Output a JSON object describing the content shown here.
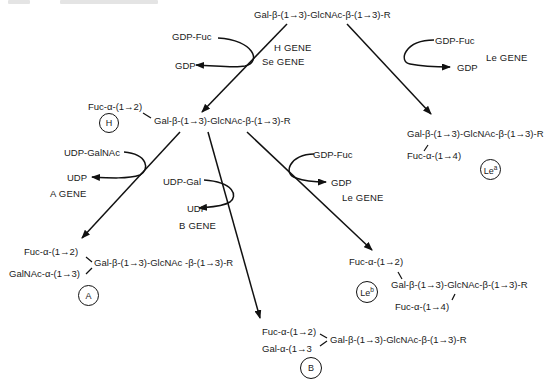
{
  "header_fragments": {
    "left": "",
    "right": ""
  },
  "precursor": {
    "structure": "Gal-β-(1→3)-GlcNAc-β-(1→3)-R"
  },
  "h_step": {
    "donor": "GDP-Fuc",
    "product": "GDP",
    "genes": [
      "H GENE",
      "Se GENE"
    ]
  },
  "lea_step": {
    "donor": "GDP-Fuc",
    "product": "GDP",
    "gene": "Le GENE"
  },
  "h_antigen": {
    "label": "H",
    "substituent": "Fuc-α-(1→2)",
    "core": "Gal-β-(1→3)-GlcNAc-β-(1→3)-R"
  },
  "lea_antigen": {
    "label": "Le",
    "label_sup": "a",
    "core": "Gal-β-(1→3)-GlcNAc-β-(1→3)-R",
    "substituent": "Fuc-α-(1→4)"
  },
  "a_step": {
    "donor": "UDP-GalNAc",
    "product": "UDP",
    "gene": "A GENE"
  },
  "b_step": {
    "donor": "UDP-Gal",
    "product": "UDP",
    "gene": "B GENE"
  },
  "leb_step": {
    "donor": "GDP-Fuc",
    "product": "GDP",
    "gene": "Le GENE"
  },
  "a_antigen": {
    "label": "A",
    "substituent_1": "Fuc-α-(1→2)",
    "substituent_2": "GalNAc-α-(1→3)",
    "core": "Gal-β-(1→3)-GlcNAc -β-(1→3)-R"
  },
  "leb_antigen": {
    "label": "Le",
    "label_sup": "b",
    "substituent_1": "Fuc-α-(1→2)",
    "core": "Gal-β-(1→3)-GlcNAc-β-(1→3)-R",
    "substituent_2": "Fuc-α-(1→4)"
  },
  "b_antigen": {
    "label": "B",
    "substituent_1": "Fuc-α-(1→2)",
    "substituent_2": "Gal-α-(1→3",
    "core": "Gal-β-(1→3)-GlcNAc-β-(1→3)-R"
  }
}
